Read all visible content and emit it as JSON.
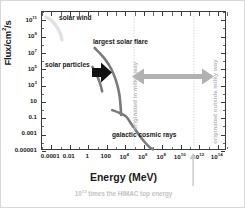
{
  "chart_data": {
    "type": "line",
    "title": "",
    "xlabel": "Energy (MeV)",
    "ylabel": "Flux/cm2/s",
    "ylabel_parts": {
      "pre": "Flux/cm",
      "sup": "2",
      "post": "/s"
    },
    "xscale": "log",
    "yscale": "log",
    "xlim": [
      -5,
      15
    ],
    "ylim": [
      -5,
      12
    ],
    "grid": false,
    "legend": "none",
    "x_ticks": [
      {
        "label": "0.0001",
        "exp": null,
        "value": -4
      },
      {
        "label": "0.01",
        "exp": null,
        "value": -2
      },
      {
        "label": "1",
        "exp": null,
        "value": 0
      },
      {
        "label": "100",
        "exp": null,
        "value": 2
      },
      {
        "label": "10",
        "exp": "4",
        "value": 4
      },
      {
        "label": "10",
        "exp": "6",
        "value": 6
      },
      {
        "label": "10",
        "exp": "8",
        "value": 8
      },
      {
        "label": "10",
        "exp": "10",
        "value": 10
      },
      {
        "label": "10",
        "exp": "12",
        "value": 12
      },
      {
        "label": "10",
        "exp": "14",
        "value": 14
      }
    ],
    "y_ticks": [
      {
        "label": "10",
        "exp": "11",
        "value": 11
      },
      {
        "label": "10",
        "exp": "9",
        "value": 9
      },
      {
        "label": "10",
        "exp": "7",
        "value": 7
      },
      {
        "label": "10",
        "exp": "5",
        "value": 5
      },
      {
        "label": "10",
        "exp": "3",
        "value": 3
      },
      {
        "label": "10",
        "exp": null,
        "value": 1
      },
      {
        "label": "0.1",
        "exp": null,
        "value": -1
      },
      {
        "label": "0.001",
        "exp": null,
        "value": -3
      },
      {
        "label": "0.00001",
        "exp": null,
        "value": -5
      }
    ],
    "series": [
      {
        "name": "solar wind",
        "color": "#e2e2e2",
        "label": "solar wind",
        "points": [
          [
            -4.6,
            11.4
          ],
          [
            -4.0,
            11.0
          ],
          [
            -3.4,
            10.2
          ],
          [
            -3.0,
            9.3
          ],
          [
            -2.85,
            8.6
          ]
        ]
      },
      {
        "name": "solar particles",
        "color": "#7a7a7a",
        "label": "solar particles",
        "points": [
          [
            0.45,
            5.3
          ],
          [
            0.8,
            4.6
          ],
          [
            1.1,
            3.8
          ],
          [
            1.35,
            3.0
          ],
          [
            1.5,
            2.3
          ]
        ]
      },
      {
        "name": "largest solar flare",
        "color": "#7a7a7a",
        "label": "largest solar flare",
        "points": [
          [
            0.7,
            7.6
          ],
          [
            1.3,
            6.9
          ],
          [
            1.9,
            6.1
          ],
          [
            2.5,
            5.0
          ],
          [
            3.0,
            3.6
          ],
          [
            3.35,
            2.0
          ],
          [
            3.5,
            0.4
          ],
          [
            3.55,
            -0.6
          ]
        ]
      },
      {
        "name": "galactic cosmic rays",
        "color": "#7a7a7a",
        "label": "galactic cosmic rays",
        "points": [
          [
            2.6,
            0.0
          ],
          [
            3.4,
            -0.35
          ],
          [
            4.1,
            -0.8
          ],
          [
            4.6,
            -1.6
          ],
          [
            5.1,
            -2.4
          ],
          [
            5.6,
            -3.2
          ],
          [
            6.1,
            -3.9
          ],
          [
            6.6,
            -4.5
          ],
          [
            7.0,
            -4.8
          ]
        ]
      }
    ],
    "annotations": [
      {
        "name": "solar-wind-label",
        "text": "solar wind",
        "x": 58,
        "y": 14,
        "color": "#1a1a1a"
      },
      {
        "name": "largest-solar-flare-label",
        "text": "largest solar flare",
        "x": 92,
        "y": 38,
        "color": "#1a1a1a"
      },
      {
        "name": "solar-particles-label",
        "text": "solar particles",
        "x": 44,
        "y": 61,
        "color": "#1a1a1a"
      },
      {
        "name": "galactic-cosmic-rays-label",
        "text": "galactic cosmic rays",
        "x": 111,
        "y": 131,
        "color": "#1a1a1a"
      }
    ],
    "region_labels": [
      {
        "name": "originated-in-milky-way-label",
        "text": "originated in milky way",
        "color": "#c9c9c9"
      },
      {
        "name": "originated-outside-milky-way-label",
        "text": "originated outside milky way",
        "color": "#c9c9c9"
      }
    ],
    "markers": [
      {
        "name": "black-pointer-arrow",
        "direction": "right",
        "color": "#111111"
      },
      {
        "name": "gray-double-arrow",
        "direction": "both",
        "color": "#b0b0b0"
      },
      {
        "name": "himac-pointer-arrow",
        "direction": "up",
        "color": "#c2c2c2"
      }
    ],
    "caption": {
      "pre": "10",
      "sup": "12",
      "post": " times the HIMAC top energy"
    }
  }
}
